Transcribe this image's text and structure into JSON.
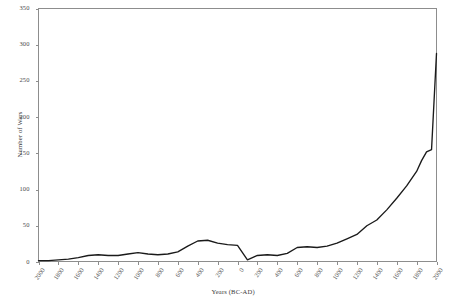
{
  "chart_data": {
    "type": "line",
    "title": "",
    "xlabel": "Years (BC-AD)",
    "ylabel": "Number of Wars",
    "xlim": [
      -2000,
      2000
    ],
    "ylim": [
      0,
      350
    ],
    "grid": false,
    "legend": null,
    "line_color": "#1a1a1a",
    "axis_color": "#8d8d8d",
    "y_ticks": [
      0,
      50,
      100,
      150,
      200,
      250,
      300,
      350
    ],
    "y_tick_labels": [
      "0",
      "50",
      "100",
      "150",
      "200",
      "250",
      "300",
      "350"
    ],
    "x_ticks": [
      -2000,
      -1800,
      -1600,
      -1400,
      -1200,
      -1000,
      -800,
      -600,
      -400,
      -200,
      0,
      200,
      400,
      600,
      800,
      1000,
      1200,
      1400,
      1600,
      1800,
      2000
    ],
    "x_tick_labels": [
      "2000",
      "1800",
      "1600",
      "1400",
      "1200",
      "1000",
      "800",
      "600",
      "400",
      "200",
      "0",
      "200",
      "400",
      "600",
      "800",
      "1000",
      "1200",
      "1400",
      "1600",
      "1800",
      "2000"
    ],
    "x": [
      -2000,
      -1900,
      -1800,
      -1700,
      -1600,
      -1500,
      -1400,
      -1300,
      -1200,
      -1100,
      -1000,
      -900,
      -800,
      -700,
      -600,
      -500,
      -400,
      -300,
      -200,
      -100,
      0,
      100,
      200,
      300,
      400,
      500,
      600,
      700,
      800,
      900,
      1000,
      1100,
      1200,
      1300,
      1400,
      1500,
      1600,
      1700,
      1800,
      1850,
      1900,
      1950,
      2000
    ],
    "y": [
      2,
      2,
      3,
      4,
      6,
      9,
      10,
      9,
      9,
      11,
      13,
      11,
      10,
      11,
      14,
      22,
      29,
      30,
      26,
      24,
      23,
      3,
      9,
      10,
      9,
      12,
      20,
      21,
      20,
      22,
      26,
      32,
      38,
      50,
      58,
      72,
      88,
      105,
      125,
      140,
      152,
      155,
      288
    ]
  }
}
